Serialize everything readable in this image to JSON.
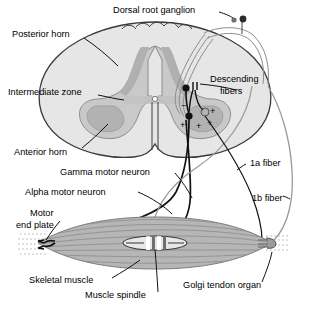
{
  "figure": {
    "background_color": "#ffffff",
    "line_color": "#111111",
    "gray_fiber_color": "#9a9a9a"
  },
  "labels": {
    "dorsal_root_ganglion": "Dorsal root ganglion",
    "posterior_horn": "Posterior horn",
    "intermediate_zone": "Intermediate zone",
    "anterior_horn": "Anterior horn",
    "descending_fibers_line1": "Descending",
    "descending_fibers_line2": "fibers",
    "gamma_motor_neuron": "Gamma motor neuron",
    "alpha_motor_neuron": "Alpha motor neuron",
    "motor_end_plate_line1": "Motor",
    "motor_end_plate_line2": "end plate",
    "skeletal_muscle": "Skeletal muscle",
    "muscle_spindle": "Muscle spindle",
    "golgi_tendon_organ": "Golgi tendon organ",
    "fiber_1a": "1a fiber",
    "fiber_1b": "1b fiber"
  },
  "synapse_marks": {
    "inhibitory": "−",
    "excitatory_1": "+",
    "excitatory_2": "+",
    "excitatory_3": "+",
    "excitatory_4": "+"
  },
  "colors": {
    "white_matter_fill": "#e3e3e3",
    "gray_matter_fill": "#c6c6c6",
    "horn_shade": "#b4b4b4",
    "muscle_fill": "#b9b9b9",
    "muscle_dark": "#8f8f8f",
    "outline": "#333333",
    "label_text": "#000000"
  }
}
